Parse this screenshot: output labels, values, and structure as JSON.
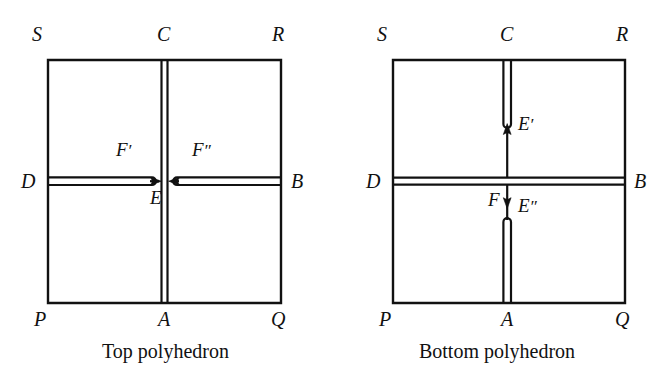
{
  "figure": {
    "width": 663,
    "height": 383,
    "background": "#ffffff",
    "ink_color": "#111111",
    "type": "geometric-diagram"
  },
  "panels": [
    {
      "id": "top-polyhedron",
      "caption": "Top polyhedron",
      "square": {
        "left": 48,
        "top": 60,
        "right": 281,
        "bottom": 303
      },
      "corner_labels": {
        "top_left": "S",
        "top_center": "C",
        "top_right": "R",
        "left_middle": "D",
        "right_middle": "B",
        "bottom_left": "P",
        "bottom_center": "A",
        "bottom_right": "Q"
      },
      "interior_labels": {
        "slit_left": "F",
        "slit_left_primes": "′",
        "slit_right": "F",
        "slit_right_primes": "″",
        "center_point": "E"
      },
      "cuts": [
        {
          "name": "vertical-slit-C-to-A",
          "orientation": "vertical",
          "style": "double-line-slit",
          "from": "C",
          "to": "A",
          "full_span": true
        },
        {
          "name": "horizontal-slit-D-to-E",
          "orientation": "horizontal",
          "style": "rounded-cap-slit-with-arrow",
          "from": "D",
          "to": "E",
          "arrow_direction": "right",
          "label": "F′"
        },
        {
          "name": "horizontal-slit-B-to-E",
          "orientation": "horizontal",
          "style": "rounded-cap-slit-with-arrow",
          "from": "B",
          "to": "E",
          "arrow_direction": "left",
          "label": "F″"
        }
      ]
    },
    {
      "id": "bottom-polyhedron",
      "caption": "Bottom polyhedron",
      "square": {
        "left": 393,
        "top": 60,
        "right": 625,
        "bottom": 303
      },
      "corner_labels": {
        "top_left": "S",
        "top_center": "C",
        "top_right": "R",
        "left_middle": "D",
        "right_middle": "B",
        "bottom_left": "P",
        "bottom_center": "A",
        "bottom_right": "Q"
      },
      "interior_labels": {
        "upper_point": "E",
        "upper_point_primes": "′",
        "lower_point": "E",
        "lower_point_primes": "″",
        "arrow_label": "F"
      },
      "cuts": [
        {
          "name": "horizontal-slit-D-to-B",
          "orientation": "horizontal",
          "style": "double-line-slit",
          "from": "D",
          "to": "B",
          "full_span": true
        },
        {
          "name": "vertical-slit-C-to-Eprime",
          "orientation": "vertical",
          "style": "rounded-cap-slit-with-arrow",
          "from": "C",
          "to": "E′",
          "arrow_direction": "up",
          "label": "E′"
        },
        {
          "name": "vertical-slit-Edoubleprime-to-A",
          "orientation": "vertical",
          "style": "rounded-cap-slit-with-arrow",
          "from": "E″",
          "to": "A",
          "arrow_direction": "down",
          "label": "E″"
        }
      ]
    }
  ]
}
